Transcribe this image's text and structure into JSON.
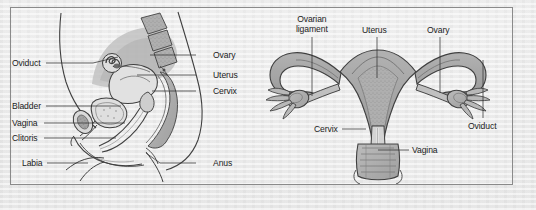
{
  "figure": {
    "frame_color": "#8a8a8a",
    "background_color": "#e8e8e8",
    "ink_color": "#1c1c1c",
    "panels": [
      {
        "id": "sagittal-section",
        "view": "lateral sagittal section of female pelvis",
        "labels": [
          {
            "id": "oviduct",
            "text": "Oviduct",
            "side": "left",
            "x": 12,
            "y": 58,
            "leader": [
              [
                46,
                63
              ],
              [
                93,
                63
              ],
              [
                118,
                57
              ]
            ]
          },
          {
            "id": "bladder",
            "text": "Bladder",
            "side": "left",
            "x": 12,
            "y": 101,
            "leader": [
              [
                46,
                106
              ],
              [
                121,
                106
              ]
            ]
          },
          {
            "id": "vagina",
            "text": "Vagina",
            "side": "left",
            "x": 12,
            "y": 118,
            "leader": [
              [
                44,
                123
              ],
              [
                125,
                123
              ]
            ]
          },
          {
            "id": "clitoris",
            "text": "Clitoris",
            "side": "left",
            "x": 12,
            "y": 133,
            "leader": [
              [
                44,
                138
              ],
              [
                116,
                138
              ]
            ]
          },
          {
            "id": "labia",
            "text": "Labia",
            "side": "left",
            "x": 22,
            "y": 158,
            "leader": [
              [
                47,
                163
              ],
              [
                88,
                163
              ]
            ]
          },
          {
            "id": "ovary",
            "text": "Ovary",
            "side": "right",
            "x": 213,
            "y": 50,
            "leader": [
              [
                196,
                55
              ],
              [
                150,
                55
              ]
            ]
          },
          {
            "id": "uterus",
            "text": "Uterus",
            "side": "right",
            "x": 213,
            "y": 70,
            "leader": [
              [
                196,
                75
              ],
              [
                137,
                75
              ]
            ]
          },
          {
            "id": "cervix",
            "text": "Cervix",
            "side": "right",
            "x": 213,
            "y": 86,
            "leader": [
              [
                196,
                91
              ],
              [
                152,
                91
              ]
            ]
          },
          {
            "id": "anus",
            "text": "Anus",
            "side": "right",
            "x": 213,
            "y": 158,
            "leader": [
              [
                196,
                163
              ],
              [
                160,
                163
              ],
              [
                146,
                153
              ]
            ]
          }
        ]
      },
      {
        "id": "frontal-section",
        "view": "anterior frontal section of uterus, oviducts and ovaries",
        "labels": [
          {
            "id": "ovarian-ligament",
            "text_line1": "Ovarian",
            "text_line2": "ligament",
            "x": 296,
            "y": 14,
            "leader": [
              [
                312,
                37
              ],
              [
                312,
                96
              ]
            ]
          },
          {
            "id": "uterus",
            "text": "Uterus",
            "x": 362,
            "y": 25,
            "leader": [
              [
                377,
                37
              ],
              [
                377,
                78
              ]
            ]
          },
          {
            "id": "ovary",
            "text": "Ovary",
            "x": 427,
            "y": 25,
            "leader": [
              [
                440,
                37
              ],
              [
                440,
                93
              ]
            ]
          },
          {
            "id": "oviduct",
            "text": "Oviduct",
            "x": 468,
            "y": 121,
            "leader": [
              [
                483,
                118
              ],
              [
                483,
                60
              ]
            ]
          },
          {
            "id": "cervix",
            "text": "Cervix",
            "x": 314,
            "y": 124,
            "leader": [
              [
                342,
                129
              ],
              [
                366,
                129
              ]
            ]
          },
          {
            "id": "vagina",
            "text": "Vagina",
            "x": 412,
            "y": 145,
            "leader": [
              [
                409,
                150
              ],
              [
                378,
                150
              ]
            ]
          }
        ]
      }
    ]
  }
}
